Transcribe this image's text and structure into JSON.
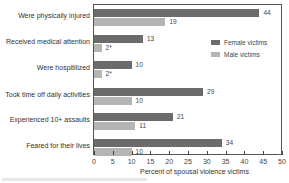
{
  "chart_data": {
    "type": "bar",
    "orientation": "horizontal",
    "title": "",
    "xlabel": "Percent of spousal violence victims",
    "ylabel": "",
    "xlim": [
      0,
      50
    ],
    "xticks": [
      0,
      5,
      10,
      15,
      20,
      25,
      30,
      35,
      40,
      45,
      50
    ],
    "grid": false,
    "legend_position": "upper right inside",
    "categories": [
      "Were physically injured",
      "Received medical attention",
      "Were hospitilized",
      "Took time off daily activities",
      "Experienced 10+ assaults",
      "Feared for their lives"
    ],
    "series": [
      {
        "name": "Female victims",
        "color": "#6b6b6b",
        "values": [
          44,
          13,
          10,
          29,
          21,
          34
        ],
        "labels": [
          "44",
          "13",
          "10",
          "29",
          "21",
          "34"
        ]
      },
      {
        "name": "Male victims",
        "color": "#b5b5b5",
        "values": [
          19,
          2,
          2,
          10,
          11,
          10
        ],
        "labels": [
          "19",
          "2*",
          "2*",
          "10",
          "11",
          "10"
        ]
      }
    ],
    "annotations": [
      "* marks estimates (2*)"
    ]
  },
  "axis": {
    "tick_labels": [
      "0",
      "5",
      "10",
      "15",
      "20",
      "25",
      "30",
      "35",
      "40",
      "45",
      "50"
    ],
    "xlabel": "Percent of spousal violence victims"
  },
  "legend": {
    "female": "Female victims",
    "male": "Male victims"
  }
}
